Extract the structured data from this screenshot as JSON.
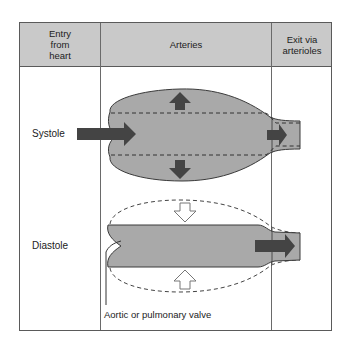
{
  "table": {
    "columns": [
      {
        "label_lines": [
          "Entry",
          "from",
          "heart"
        ]
      },
      {
        "label": "Arteries"
      },
      {
        "label_lines": [
          "Exit via",
          "arterioles"
        ]
      }
    ],
    "col0_line1": "Entry",
    "col0_line2": "from",
    "col0_line3": "heart",
    "col1": "Arteries",
    "col2_line1": "Exit via",
    "col2_line2": "arterioles"
  },
  "rows": {
    "systole": "Systole",
    "diastole": "Diastole"
  },
  "annotations": {
    "valve": "Aortic or pulmonary valve"
  },
  "colors": {
    "header_bg": "#c9c9c9",
    "vessel_fill": "#a9a9a9",
    "arrow_dark": "#444444",
    "border": "#5a5a5a"
  }
}
